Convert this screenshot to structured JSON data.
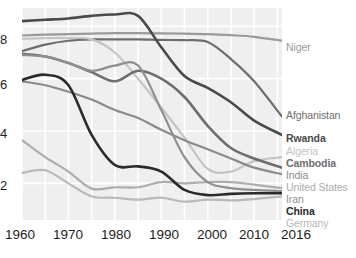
{
  "chart_data": {
    "type": "line",
    "title": "",
    "subtitle": "",
    "xlabel": "",
    "ylabel": "",
    "xlim": [
      1960,
      2016
    ],
    "ylim": [
      0.6,
      8.7
    ],
    "grid": true,
    "legend_position": "right-end-of-line",
    "x_ticks": [
      "1960",
      "1970",
      "1980",
      "1990",
      "2000",
      "2010",
      "2016"
    ],
    "x_tick_values": [
      1960,
      1970,
      1980,
      1990,
      2000,
      2010,
      2016
    ],
    "y_ticks": [
      "2",
      "4",
      "6",
      "8"
    ],
    "y_tick_values": [
      2,
      4,
      6,
      8
    ],
    "x": [
      1960,
      1965,
      1970,
      1975,
      1980,
      1985,
      1990,
      1995,
      2000,
      2005,
      2010,
      2016
    ],
    "series": [
      {
        "name": "Niger",
        "label": "Niger",
        "color": "#9a9a9a",
        "bold": false,
        "values": [
          7.65,
          7.68,
          7.7,
          7.72,
          7.74,
          7.74,
          7.73,
          7.72,
          7.7,
          7.66,
          7.6,
          7.45
        ]
      },
      {
        "name": "Afghanistan",
        "label": "Afghanistan",
        "color": "#6d6d6d",
        "bold": false,
        "values": [
          7.05,
          7.3,
          7.45,
          7.5,
          7.5,
          7.5,
          7.48,
          7.47,
          7.4,
          6.75,
          5.9,
          4.55
        ]
      },
      {
        "name": "Rwanda",
        "label": "Rwanda",
        "color": "#4a4a4a",
        "bold": true,
        "values": [
          8.2,
          8.25,
          8.3,
          8.4,
          8.45,
          8.4,
          7.2,
          6.1,
          5.65,
          5.1,
          4.4,
          3.85
        ]
      },
      {
        "name": "Algeria",
        "label": "Algeria",
        "color": "#c4c4c4",
        "bold": false,
        "values": [
          7.52,
          7.55,
          7.55,
          7.5,
          7.0,
          6.0,
          4.9,
          3.75,
          2.55,
          2.45,
          2.85,
          3.0
        ]
      },
      {
        "name": "Cambodia",
        "label": "Cambodia",
        "color": "#6e6e6e",
        "bold": true,
        "values": [
          6.95,
          6.85,
          6.6,
          6.25,
          5.9,
          6.3,
          6.0,
          5.3,
          4.2,
          3.35,
          2.95,
          2.6
        ]
      },
      {
        "name": "India",
        "label": "India",
        "color": "#8a8a8a",
        "bold": false,
        "values": [
          5.9,
          5.75,
          5.5,
          5.2,
          4.8,
          4.5,
          4.05,
          3.65,
          3.3,
          2.95,
          2.6,
          2.35
        ]
      },
      {
        "name": "United States",
        "label": "United States",
        "color": "#adadad",
        "bold": false,
        "values": [
          3.65,
          3.0,
          2.45,
          1.8,
          1.85,
          1.85,
          2.05,
          2.0,
          2.05,
          2.05,
          1.95,
          1.82
        ]
      },
      {
        "name": "Iran",
        "label": "Iran",
        "color": "#8f8f8f",
        "bold": false,
        "values": [
          6.9,
          6.85,
          6.6,
          6.3,
          6.5,
          6.5,
          4.8,
          3.0,
          2.05,
          1.82,
          1.75,
          1.7
        ]
      },
      {
        "name": "China",
        "label": "China",
        "color": "#2a2a2a",
        "bold": true,
        "values": [
          5.95,
          6.15,
          5.75,
          3.85,
          2.7,
          2.65,
          2.45,
          1.75,
          1.55,
          1.6,
          1.62,
          1.62
        ]
      },
      {
        "name": "Germany",
        "label": "Germany",
        "color": "#b8b8b8",
        "bold": false,
        "values": [
          2.4,
          2.5,
          2.0,
          1.5,
          1.45,
          1.38,
          1.45,
          1.3,
          1.38,
          1.35,
          1.4,
          1.5
        ]
      }
    ],
    "label_positions": [
      {
        "name": "Niger",
        "top": 42
      },
      {
        "name": "Afghanistan",
        "top": 110
      },
      {
        "name": "Rwanda",
        "top": 133
      },
      {
        "name": "Algeria",
        "top": 146
      },
      {
        "name": "Cambodia",
        "top": 158
      },
      {
        "name": "India",
        "top": 170
      },
      {
        "name": "United States",
        "top": 182
      },
      {
        "name": "Iran",
        "top": 194
      },
      {
        "name": "China",
        "top": 206
      },
      {
        "name": "Germany",
        "top": 218
      }
    ]
  },
  "axes": {
    "y_label_positions": [
      {
        "text": "8",
        "top": 33
      },
      {
        "text": "6",
        "top": 78
      },
      {
        "text": "4",
        "top": 127
      },
      {
        "text": "2",
        "top": 179
      }
    ],
    "x_label_positions": [
      {
        "text": "1960",
        "left": 5
      },
      {
        "text": "1970",
        "left": 53
      },
      {
        "text": "1980",
        "left": 101
      },
      {
        "text": "1990",
        "left": 149
      },
      {
        "text": "2000",
        "left": 197
      },
      {
        "text": "2010",
        "left": 239
      },
      {
        "text": "2016",
        "left": 281
      }
    ]
  },
  "colors": {
    "plot_background": "#efefef",
    "gridline": "#ffffff",
    "page_background": "#ffffff",
    "tick_text": "#1c1c1c"
  }
}
